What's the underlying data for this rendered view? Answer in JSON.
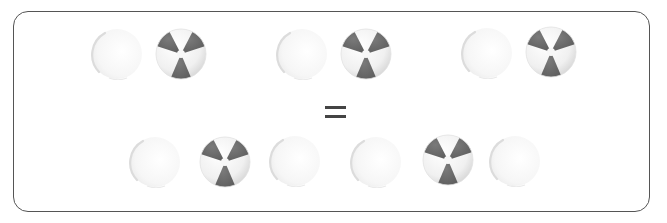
{
  "figure": {
    "type": "ratio-equivalence",
    "colors": {
      "frame_border": "#555555",
      "ball_wedge": "#6e6e6e",
      "ball_light": "#f2f2f2",
      "ghost_fill": "#f4f4f4",
      "equals_sign": "#444444"
    },
    "top_row": {
      "groups": [
        {
          "items": [
            "ghost-ball",
            "beach-ball"
          ]
        },
        {
          "items": [
            "ghost-ball",
            "beach-ball"
          ]
        },
        {
          "items": [
            "ghost-ball",
            "beach-ball"
          ]
        }
      ],
      "counts": {
        "beach_balls": 3,
        "ghost_balls": 3
      }
    },
    "operator": {
      "symbol": "="
    },
    "bottom_row": {
      "groups": [
        {
          "items": [
            "ghost-ball",
            "beach-ball",
            "ghost-ball"
          ]
        },
        {
          "items": [
            "ghost-ball",
            "beach-ball",
            "ghost-ball"
          ]
        }
      ],
      "counts": {
        "beach_balls": 2,
        "ghost_balls": 4
      }
    }
  }
}
